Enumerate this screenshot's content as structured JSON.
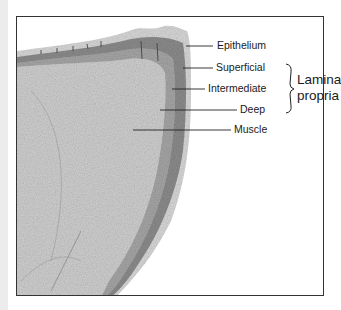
{
  "figure": {
    "labels": [
      {
        "id": "epithelium",
        "text": "Epithelium"
      },
      {
        "id": "superficial",
        "text": "Superficial"
      },
      {
        "id": "intermediate",
        "text": "Intermediate"
      },
      {
        "id": "deep",
        "text": "Deep"
      },
      {
        "id": "muscle",
        "text": "Muscle"
      }
    ],
    "group_label": {
      "line1": "Lamina",
      "line2": "propria",
      "spans": [
        "superficial",
        "intermediate",
        "deep"
      ]
    },
    "colors": {
      "frame": "#333333",
      "text": "#1a1a1a",
      "leader_lines": "#222222",
      "tissue_light": "#c9c9c9",
      "tissue_dark": "#6e6e6e"
    }
  }
}
